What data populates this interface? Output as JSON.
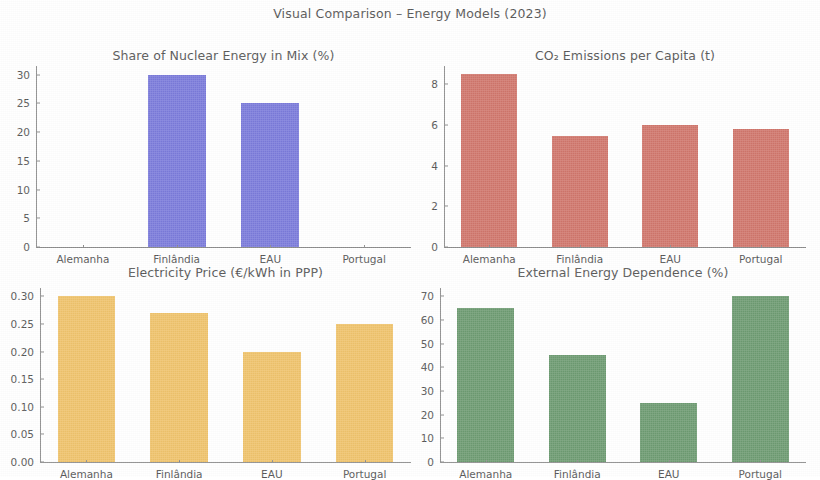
{
  "figure": {
    "suptitle": "Visual Comparison – Energy Models (2023)",
    "background": "#ffffff"
  },
  "chart_data": [
    {
      "type": "bar",
      "panel": "top-left",
      "title": "Share of Nuclear Energy in Mix (%)",
      "categories": [
        "Alemanha",
        "Finlândia",
        "EAU",
        "Portugal"
      ],
      "values": [
        0,
        30,
        25,
        0
      ],
      "xlabel": "",
      "ylabel": "",
      "ylim": [
        0,
        31.5
      ],
      "yticks": [
        0,
        5,
        10,
        15,
        20,
        25,
        30
      ],
      "ytick_labels": [
        "0",
        "5",
        "10",
        "15",
        "20",
        "25",
        "30"
      ],
      "color": "#7B7BDB",
      "grid": false,
      "legend": "none"
    },
    {
      "type": "bar",
      "panel": "top-right",
      "title": "CO₂ Emissions per Capita (t)",
      "categories": [
        "Alemanha",
        "Finlândia",
        "EAU",
        "Portugal"
      ],
      "values": [
        8.5,
        5.45,
        6.0,
        5.8
      ],
      "xlabel": "",
      "ylabel": "",
      "ylim": [
        0,
        8.9
      ],
      "yticks": [
        0,
        2,
        4,
        6,
        8
      ],
      "ytick_labels": [
        "0",
        "2",
        "4",
        "6",
        "8"
      ],
      "color": "#D0766C",
      "grid": false,
      "legend": "none"
    },
    {
      "type": "bar",
      "panel": "bottom-left",
      "title": "Electricity Price (€/kWh in PPP)",
      "categories": [
        "Alemanha",
        "Finlândia",
        "EAU",
        "Portugal"
      ],
      "values": [
        0.3,
        0.27,
        0.2,
        0.25
      ],
      "xlabel": "",
      "ylabel": "",
      "ylim": [
        0,
        0.315
      ],
      "yticks": [
        0.0,
        0.05,
        0.1,
        0.15,
        0.2,
        0.25,
        0.3
      ],
      "ytick_labels": [
        "0.00",
        "0.05",
        "0.10",
        "0.15",
        "0.20",
        "0.25",
        "0.30"
      ],
      "color": "#EFC36B",
      "grid": false,
      "legend": "none"
    },
    {
      "type": "bar",
      "panel": "bottom-right",
      "title": "External Energy Dependence (%)",
      "categories": [
        "Alemanha",
        "Finlândia",
        "EAU",
        "Portugal"
      ],
      "values": [
        65,
        45,
        25,
        70
      ],
      "xlabel": "",
      "ylabel": "",
      "ylim": [
        0,
        73.5
      ],
      "yticks": [
        0,
        10,
        20,
        30,
        40,
        50,
        60,
        70
      ],
      "ytick_labels": [
        "0",
        "10",
        "20",
        "30",
        "40",
        "50",
        "60",
        "70"
      ],
      "color": "#6E9B72",
      "grid": false,
      "legend": "none"
    }
  ],
  "layout": {
    "panels": [
      {
        "left": 36,
        "top": 48,
        "width": 375,
        "height": 200,
        "plot_left": 36,
        "plot_top": 66,
        "plot_width": 375,
        "plot_height": 182
      },
      {
        "left": 444,
        "top": 48,
        "width": 362,
        "height": 200,
        "plot_left": 444,
        "plot_top": 66,
        "plot_width": 362,
        "plot_height": 182
      },
      {
        "left": 40,
        "top": 265,
        "width": 371,
        "height": 198,
        "plot_left": 40,
        "plot_top": 288,
        "plot_width": 371,
        "plot_height": 175
      },
      {
        "left": 440,
        "top": 265,
        "width": 366,
        "height": 198,
        "plot_left": 440,
        "plot_top": 288,
        "plot_width": 366,
        "plot_height": 175
      }
    ],
    "bar_width_ratio": 0.62
  }
}
